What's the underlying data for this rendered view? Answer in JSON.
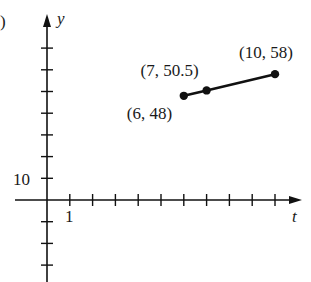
{
  "panel_marker": ")",
  "chart_data": {
    "type": "line",
    "title": "",
    "xlabel": "t",
    "ylabel": "y",
    "x_tick_label": "1",
    "y_tick_label": "10",
    "x_tick_step": 1,
    "y_tick_step": 10,
    "xlim": [
      -1.5,
      11
    ],
    "ylim": [
      -35,
      85
    ],
    "grid": false,
    "series": [
      {
        "name": "segment",
        "points": [
          {
            "x": 6,
            "y": 48,
            "label": "(6, 48)"
          },
          {
            "x": 7,
            "y": 50.5,
            "label": "(7, 50.5)"
          },
          {
            "x": 10,
            "y": 58,
            "label": "(10, 58)"
          }
        ]
      }
    ]
  }
}
